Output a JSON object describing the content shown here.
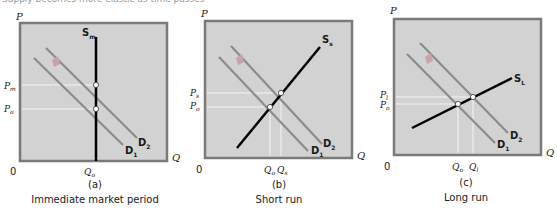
{
  "caption_top": "Supply becomes more elastic as time passes",
  "panels": [
    {
      "id": "a",
      "letter": "(a)",
      "title": "Immediate market period",
      "axis": {
        "y": "P",
        "x": "Q",
        "origin": "0"
      },
      "supply_label": "S",
      "supply_sub": "m",
      "demand1_label": "D",
      "demand1_sub": "1",
      "demand2_label": "D",
      "demand2_sub": "2",
      "price_labels": [
        {
          "main": "P",
          "sub": "m"
        },
        {
          "main": "P",
          "sub": "o"
        }
      ],
      "quantity_labels": [
        {
          "main": "Q",
          "sub": "o"
        }
      ]
    },
    {
      "id": "b",
      "letter": "(b)",
      "title": "Short run",
      "axis": {
        "y": "P",
        "x": "Q",
        "origin": "0"
      },
      "supply_label": "S",
      "supply_sub": "s",
      "demand1_label": "D",
      "demand1_sub": "1",
      "demand2_label": "D",
      "demand2_sub": "2",
      "price_labels": [
        {
          "main": "P",
          "sub": "s"
        },
        {
          "main": "P",
          "sub": "o"
        }
      ],
      "quantity_labels": [
        {
          "main": "Q",
          "sub": "o"
        },
        {
          "main": "Q",
          "sub": "s"
        }
      ]
    },
    {
      "id": "c",
      "letter": "(c)",
      "title": "Long run",
      "axis": {
        "y": "P",
        "x": "Q",
        "origin": "0"
      },
      "supply_label": "S",
      "supply_sub": "L",
      "demand1_label": "D",
      "demand1_sub": "1",
      "demand2_label": "D",
      "demand2_sub": "2",
      "price_labels": [
        {
          "main": "P",
          "sub": "l"
        },
        {
          "main": "P",
          "sub": "o"
        }
      ],
      "quantity_labels": [
        {
          "main": "Q",
          "sub": "o"
        },
        {
          "main": "Q",
          "sub": "l"
        }
      ]
    }
  ],
  "colors": {
    "plot_bg": "#d2d2d2",
    "plot_border": "#7a7a7a",
    "supply": "#000000",
    "demand": "#8c8c8c",
    "shift_arrow": "#c9a3a8",
    "guide": "#f4f4f4"
  }
}
